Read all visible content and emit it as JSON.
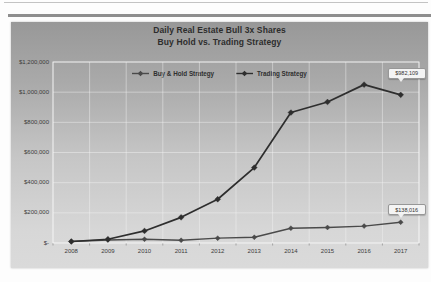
{
  "chart": {
    "title_line1": "Daily Real Estate Bull 3x Shares",
    "title_line2": "Buy Hold vs. Trading Strategy"
  },
  "chart_data": {
    "type": "line",
    "title": "Daily Real Estate Bull 3x Shares",
    "subtitle": "Buy Hold vs. Trading Strategy",
    "categories": [
      "2008",
      "2009",
      "2010",
      "2011",
      "2012",
      "2013",
      "2014",
      "2015",
      "2016",
      "2017"
    ],
    "series": [
      {
        "name": "Buy & Hold Strategy",
        "color": "#4a4a4a",
        "values": [
          10000,
          20000,
          25000,
          18000,
          32000,
          38000,
          98000,
          103000,
          112000,
          138016
        ],
        "end_label": "$138,016"
      },
      {
        "name": "Trading Strategy",
        "color": "#2e2e2e",
        "values": [
          10000,
          25000,
          80000,
          170000,
          290000,
          500000,
          865000,
          935000,
          1050000,
          982109
        ],
        "end_label": "$982,109"
      }
    ],
    "ylim": [
      0,
      1200000
    ],
    "ytick_labels_top_to_bottom": [
      "$1,200,000",
      "$1,000,000",
      "$800,000",
      "$600,000",
      "$400,000",
      "$200,000",
      "$-"
    ],
    "grid": true,
    "legend_position": "top",
    "marker": "diamond"
  }
}
